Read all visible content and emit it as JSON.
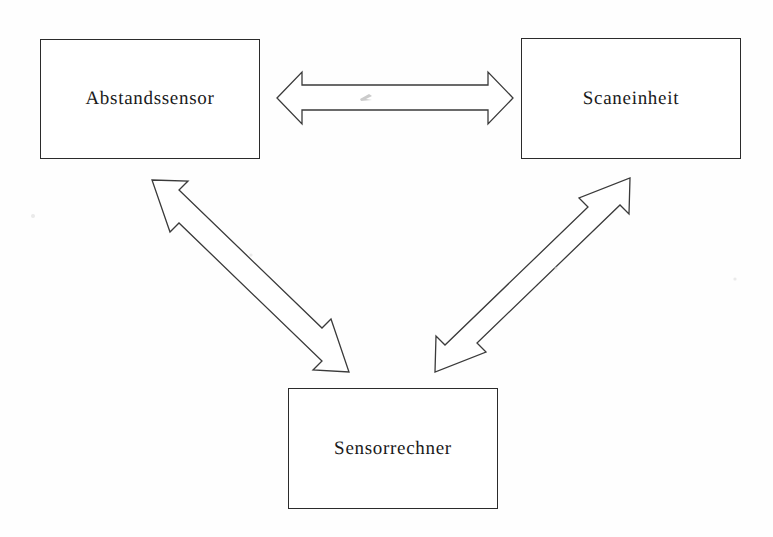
{
  "diagram": {
    "background_color": "#fefefe",
    "line_color": "#3a3a3a",
    "text_color": "#1a1a1a",
    "nodes": [
      {
        "id": "abstandssensor",
        "label": "Abstandssensor",
        "x": 40,
        "y": 39,
        "width": 220,
        "height": 120
      },
      {
        "id": "scaneinheit",
        "label": "Scaneinheit",
        "x": 521,
        "y": 38,
        "width": 220,
        "height": 121
      },
      {
        "id": "sensorrechner",
        "label": "Sensorrechner",
        "x": 288,
        "y": 388,
        "width": 210,
        "height": 121
      }
    ],
    "connectors": [
      {
        "id": "abstandssensor-scaneinheit",
        "type": "double-headed-arrow",
        "orientation": "horizontal",
        "from": "abstandssensor",
        "to": "scaneinheit",
        "label": ""
      },
      {
        "id": "abstandssensor-sensorrechner",
        "type": "double-headed-arrow",
        "orientation": "diagonal-down-right",
        "from": "abstandssensor",
        "to": "sensorrechner",
        "label": ""
      },
      {
        "id": "scaneinheit-sensorrechner",
        "type": "double-headed-arrow",
        "orientation": "diagonal-down-left",
        "from": "scaneinheit",
        "to": "sensorrechner",
        "label": ""
      }
    ]
  }
}
